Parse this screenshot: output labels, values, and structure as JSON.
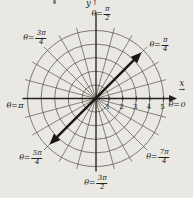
{
  "figure": {
    "background_color": "#eae8e2",
    "ink_color": "#25221d",
    "grid_color": "#57534c",
    "bold_line_color": "#1b1813"
  },
  "chart_data": {
    "type": "line",
    "coordinate_system": "polar",
    "plotted_equation": "θ = π/4",
    "plotted_line": {
      "angle_degrees": 45,
      "r_min": -4.8,
      "r_max": 4.8,
      "style": "bold double-headed arrow through the pole"
    },
    "polar_grid": {
      "circle_radii": [
        1,
        2,
        3,
        4,
        5
      ],
      "spoke_step_degrees": 15,
      "spoke_overhang_px": 73,
      "grid_on": true
    },
    "axes": {
      "x_label": "x",
      "y_label": "y",
      "x_arrow": "→",
      "y_arrow": "↑",
      "x_ticks": [
        "1",
        "2",
        "3",
        "4",
        "5"
      ],
      "x_range_shown": [
        -5.4,
        5.9
      ],
      "y_range_shown": [
        -5.4,
        6.3
      ]
    },
    "theta_labels": [
      {
        "id": "0",
        "prefix": "θ=",
        "value": "0",
        "angle_degrees": 0
      },
      {
        "id": "pi-4",
        "prefix": "θ=",
        "num": "π",
        "den": "4",
        "angle_degrees": 45
      },
      {
        "id": "pi-2",
        "prefix": "θ=",
        "num": "π",
        "den": "2",
        "angle_degrees": 90
      },
      {
        "id": "3pi-4",
        "prefix": "θ=",
        "num": "3π",
        "den": "4",
        "angle_degrees": 135
      },
      {
        "id": "pi",
        "prefix": "θ=",
        "value": "π",
        "angle_degrees": 180
      },
      {
        "id": "5pi-4",
        "prefix": "θ=",
        "num": "5π",
        "den": "4",
        "angle_degrees": 225
      },
      {
        "id": "3pi-2",
        "prefix": "θ=",
        "num": "3π",
        "den": "2",
        "angle_degrees": 270
      },
      {
        "id": "7pi-4",
        "prefix": "θ=",
        "num": "7π",
        "den": "4",
        "angle_degrees": 315
      }
    ]
  }
}
